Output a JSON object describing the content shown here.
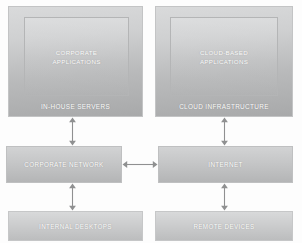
{
  "diagram": {
    "colors": {
      "box_fill_light": "#d6d7d8",
      "box_fill_dark": "#a8a9aa",
      "box_border": "#c3c4c5",
      "label_text": "#ffffff",
      "arrow": "#8f9091",
      "background": "#fdfdfd"
    },
    "nodes": {
      "in_house_servers": {
        "label": "IN-HOUSE SERVERS",
        "inner_label_line1": "CORPORATE",
        "inner_label_line2": "APPLICATIONS"
      },
      "cloud_infrastructure": {
        "label": "CLOUD INFRASTRUCTURE",
        "inner_label_line1": "CLOUD-BASED",
        "inner_label_line2": "APPLICATIONS"
      },
      "corporate_network": {
        "label": "CORPORATE NETWORK"
      },
      "internet": {
        "label": "INTERNET"
      },
      "internal_desktops": {
        "label": "INTERNAL DESKTOPS"
      },
      "remote_devices": {
        "label": "REMOTE DEVICES"
      }
    },
    "connections": [
      {
        "name": "servers-to-corporate-network",
        "type": "bidirectional",
        "orientation": "vertical"
      },
      {
        "name": "cloud-to-internet",
        "type": "bidirectional",
        "orientation": "vertical"
      },
      {
        "name": "corporate-network-to-internet",
        "type": "bidirectional",
        "orientation": "horizontal"
      },
      {
        "name": "corporate-network-to-desktops",
        "type": "bidirectional",
        "orientation": "vertical"
      },
      {
        "name": "internet-to-remote-devices",
        "type": "bidirectional",
        "orientation": "vertical"
      }
    ]
  }
}
